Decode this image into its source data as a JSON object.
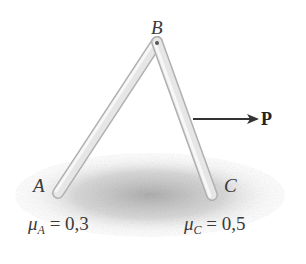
{
  "diagram": {
    "type": "statics-two-bar-frame",
    "points": {
      "A": {
        "label": "A",
        "x": 58,
        "y": 193
      },
      "B": {
        "label": "B",
        "x": 157,
        "y": 42
      },
      "C": {
        "label": "C",
        "x": 212,
        "y": 195
      }
    },
    "members": [
      {
        "name": "AB",
        "from": "A",
        "to": "B"
      },
      {
        "name": "BC",
        "from": "B",
        "to": "C"
      }
    ],
    "force": {
      "label": "P",
      "direction": "right",
      "applied_on": "BC"
    },
    "friction": [
      {
        "symbol": "μ",
        "subscript": "A",
        "equals": "=",
        "value": "0,3"
      },
      {
        "symbol": "μ",
        "subscript": "C",
        "equals": "=",
        "value": "0,5"
      }
    ],
    "colors": {
      "bar_fill": "#e4e4e4",
      "bar_edge": "#b8b8b8",
      "arrow": "#333333",
      "ground_shadow": "#a0a0a0",
      "text": "#3a3a3a"
    }
  }
}
